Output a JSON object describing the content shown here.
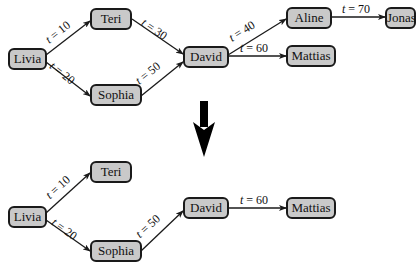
{
  "top_graph": {
    "nodes": {
      "livia": "Livia",
      "teri": "Teri",
      "sophia": "Sophia",
      "david": "David",
      "aline": "Aline",
      "mattias": "Mattias",
      "jonas": "Jonas"
    },
    "edges": [
      {
        "from": "Livia",
        "to": "Teri",
        "var": "t",
        "value": "= 10"
      },
      {
        "from": "Livia",
        "to": "Sophia",
        "var": "t",
        "value": "= 20"
      },
      {
        "from": "Teri",
        "to": "David",
        "var": "t",
        "value": "= 30"
      },
      {
        "from": "Sophia",
        "to": "David",
        "var": "t",
        "value": "= 50"
      },
      {
        "from": "David",
        "to": "Aline",
        "var": "t",
        "value": "= 40"
      },
      {
        "from": "David",
        "to": "Mattias",
        "var": "t",
        "value": "= 60"
      },
      {
        "from": "Aline",
        "to": "Jonas",
        "var": "t",
        "value": "= 70"
      }
    ]
  },
  "bottom_graph": {
    "nodes": {
      "livia": "Livia",
      "teri": "Teri",
      "sophia": "Sophia",
      "david": "David",
      "mattias": "Mattias"
    },
    "edges": [
      {
        "from": "Livia",
        "to": "Teri",
        "var": "t",
        "value": "= 10"
      },
      {
        "from": "Livia",
        "to": "Sophia",
        "var": "t",
        "value": "= 20"
      },
      {
        "from": "Sophia",
        "to": "David",
        "var": "t",
        "value": "= 50"
      },
      {
        "from": "David",
        "to": "Mattias",
        "var": "t",
        "value": "= 60"
      }
    ]
  },
  "colors": {
    "node_fill": "#c9c9c9",
    "node_border": "#1a1a1a",
    "edge": "#1a1a1a"
  }
}
